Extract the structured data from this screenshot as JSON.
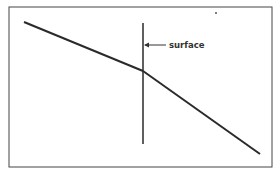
{
  "diagram": {
    "label": "surface",
    "colors": {
      "line": "#2a2a2a",
      "frame": "#444444",
      "background": "#ffffff"
    }
  }
}
